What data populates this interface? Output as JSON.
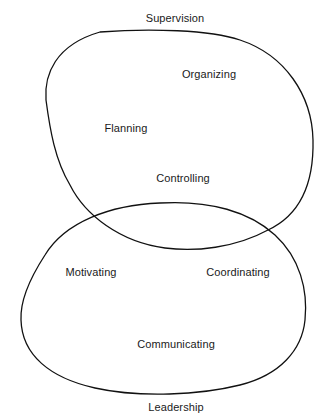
{
  "diagram": {
    "type": "overlapping-sets",
    "sets": [
      {
        "name": "Supervision",
        "items": [
          "Organizing",
          "Flanning",
          "Controlling"
        ]
      },
      {
        "name": "Leadership",
        "items": [
          "Motivating",
          "Coordinating",
          "Communicating"
        ]
      }
    ],
    "labels": {
      "supervision": "Supervision",
      "leadership": "Leadership",
      "organizing": "Organizing",
      "planning": "Flanning",
      "controlling": "Controlling",
      "motivating": "Motivating",
      "coordinating": "Coordinating",
      "communicating": "Communicating"
    },
    "colors": {
      "line": "#111111",
      "text": "#1a1a1a",
      "background": "#ffffff"
    }
  }
}
